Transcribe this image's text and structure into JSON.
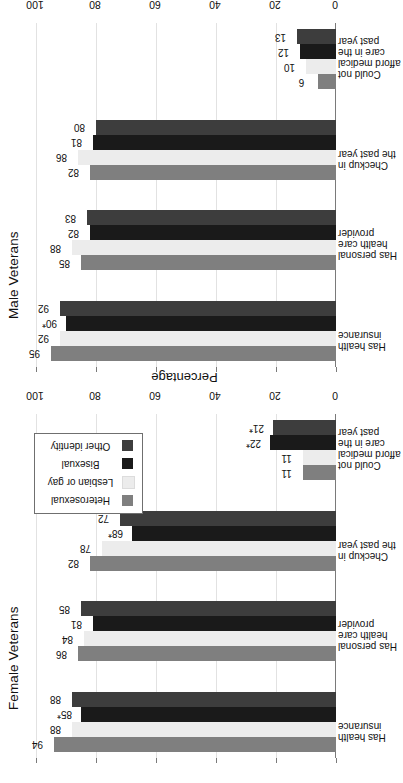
{
  "figure": {
    "background_color": "#ffffff",
    "orientation": "rotated-90"
  },
  "legend": {
    "name": "series-legend",
    "position": "upper-right-of-female-panel",
    "entries": [
      {
        "label": "Heterosexual",
        "color": "#7f7f7f"
      },
      {
        "label": "Lesbian or gay",
        "color": "#ececec"
      },
      {
        "label": "Bisexual",
        "color": "#1a1a1a"
      },
      {
        "label": "Other identity",
        "color": "#3d3d3d"
      }
    ]
  },
  "axis": {
    "value_axis_title": "Percentage",
    "ticks": [
      "0",
      "20",
      "40",
      "60",
      "80",
      "100"
    ],
    "min": 0,
    "max": 100
  },
  "categories": [
    {
      "lines": [
        "Has health",
        "insurance"
      ]
    },
    {
      "lines": [
        "Has personal",
        "health care",
        "provider"
      ]
    },
    {
      "lines": [
        "Checkup in",
        "the past year"
      ]
    },
    {
      "lines": [
        "Could not",
        "afford medical",
        "care in the",
        "past year"
      ]
    }
  ],
  "panels": [
    {
      "id": "male",
      "title": "Male Veterans",
      "bar_labels": [
        [
          "95",
          "92",
          "90*",
          "92"
        ],
        [
          "85",
          "88",
          "82",
          "83"
        ],
        [
          "82",
          "86",
          "81",
          "80"
        ],
        [
          "6",
          "10",
          "12",
          "13"
        ]
      ]
    },
    {
      "id": "female",
      "title": "Female Veterans",
      "bar_labels": [
        [
          "94",
          "88",
          "85*",
          "88"
        ],
        [
          "86",
          "84",
          "81",
          "85"
        ],
        [
          "82",
          "78",
          "68*",
          "72"
        ],
        [
          "11",
          "11",
          "22*",
          "21*"
        ]
      ]
    }
  ],
  "chart_data": {
    "type": "bar",
    "xlabel": "",
    "ylabel": "Percentage",
    "ylim": [
      0,
      100
    ],
    "grid": true,
    "legend_position": "upper right",
    "orientation": "vertical-bars-in-rotated-page",
    "categories": [
      "Has health insurance",
      "Has personal health care provider",
      "Checkup in the past year",
      "Could not afford medical care in the past year"
    ],
    "panels": [
      {
        "name": "Male Veterans",
        "series": [
          {
            "name": "Heterosexual",
            "values": [
              95,
              85,
              82,
              6
            ]
          },
          {
            "name": "Lesbian or gay",
            "values": [
              92,
              88,
              86,
              10
            ]
          },
          {
            "name": "Bisexual",
            "values": [
              90,
              82,
              81,
              12
            ]
          },
          {
            "name": "Other identity",
            "values": [
              92,
              83,
              80,
              13
            ]
          }
        ],
        "annotations": [
          {
            "category": "Has health insurance",
            "series": "Bisexual",
            "label": "90*",
            "note": "significantly different from heterosexual"
          }
        ]
      },
      {
        "name": "Female Veterans",
        "series": [
          {
            "name": "Heterosexual",
            "values": [
              94,
              86,
              82,
              11
            ]
          },
          {
            "name": "Lesbian or gay",
            "values": [
              88,
              84,
              78,
              11
            ]
          },
          {
            "name": "Bisexual",
            "values": [
              85,
              81,
              68,
              22
            ]
          },
          {
            "name": "Other identity",
            "values": [
              88,
              85,
              72,
              21
            ]
          }
        ],
        "annotations": [
          {
            "category": "Has health insurance",
            "series": "Bisexual",
            "label": "85*"
          },
          {
            "category": "Checkup in the past year",
            "series": "Bisexual",
            "label": "68*"
          },
          {
            "category": "Could not afford medical care in the past year",
            "series": "Bisexual",
            "label": "22*"
          },
          {
            "category": "Could not afford medical care in the past year",
            "series": "Other identity",
            "label": "21*"
          }
        ]
      }
    ]
  }
}
